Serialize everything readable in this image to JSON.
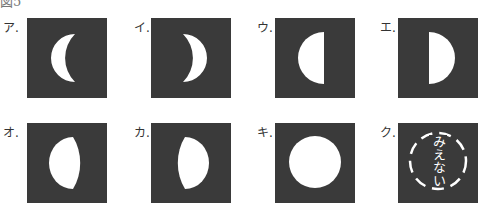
{
  "figure": {
    "title": "図5",
    "sky_color": "#3a3a3a",
    "moon_color": "#ffffff",
    "items": [
      {
        "label": "ア.",
        "shape": "crescent-left",
        "description": "細い三日月（左側が光る）"
      },
      {
        "label": "イ.",
        "shape": "crescent-right",
        "description": "細い三日月（右側が光る）"
      },
      {
        "label": "ウ.",
        "shape": "half-left",
        "description": "半月（左側が光る）"
      },
      {
        "label": "エ.",
        "shape": "half-right",
        "description": "半月（右側が光る）"
      },
      {
        "label": "オ.",
        "shape": "gibbous-left",
        "description": "ふくらんだ月（左側が光る）"
      },
      {
        "label": "カ.",
        "shape": "gibbous-right",
        "description": "ふくらんだ月（右側が光る）"
      },
      {
        "label": "キ.",
        "shape": "full",
        "description": "満月"
      },
      {
        "label": "ク.",
        "shape": "new",
        "description": "新月",
        "text": "みえない"
      }
    ]
  }
}
